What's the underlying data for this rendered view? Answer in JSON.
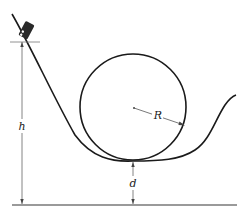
{
  "diagram": {
    "type": "roller-coaster-loop",
    "labels": {
      "height": "h",
      "radius": "R",
      "clearance": "d"
    },
    "colors": {
      "track": "#1a1a1a",
      "dimension": "#555555",
      "ground": "#9a9a9a",
      "car": "#2a2a2a"
    }
  }
}
